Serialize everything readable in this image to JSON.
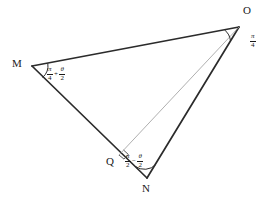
{
  "figure": {
    "type": "geometry-diagram",
    "background_color": "#ffffff",
    "stroke_color_main": "#2b2b2b",
    "stroke_color_auxiliary": "#9a9a9a",
    "vertices": [
      {
        "id": "M",
        "label": "M",
        "x": 32,
        "y": 66,
        "label_x": 12,
        "label_y": 58
      },
      {
        "id": "O",
        "label": "O",
        "x": 239,
        "y": 27,
        "label_x": 243,
        "label_y": 6
      },
      {
        "id": "N",
        "label": "N",
        "x": 147,
        "y": 178,
        "label_x": 142,
        "label_y": 184
      },
      {
        "id": "Q",
        "label": "Q",
        "x": 119,
        "y": 155,
        "label_x": 106,
        "label_y": 157
      }
    ],
    "edges": [
      {
        "id": "MO",
        "from": "M",
        "to": "O",
        "style": "solid-thick"
      },
      {
        "id": "ON",
        "from": "O",
        "to": "N",
        "style": "solid-thick"
      },
      {
        "id": "MN",
        "from": "M",
        "to": "N",
        "style": "solid-thick"
      },
      {
        "id": "OQ",
        "from": "O",
        "to": "Q",
        "style": "thin-auxiliary"
      }
    ],
    "angles": [
      {
        "id": "angle-O",
        "at": "O",
        "marker": "arc",
        "label_x": 249,
        "label_y": 33,
        "parts": [
          {
            "kind": "fraction",
            "numerator": "π",
            "denominator": "4"
          }
        ]
      },
      {
        "id": "angle-M",
        "at": "M",
        "marker": "arc",
        "label_x": 47,
        "label_y": 68,
        "parts": [
          {
            "kind": "fraction",
            "numerator": "π",
            "denominator": "4"
          },
          {
            "kind": "operator",
            "text": "+"
          },
          {
            "kind": "fraction",
            "numerator": "θ",
            "denominator": "2"
          }
        ]
      },
      {
        "id": "angle-N",
        "at": "N",
        "marker": "arc",
        "label_x": 125,
        "label_y": 155,
        "parts": [
          {
            "kind": "fraction",
            "numerator": "π",
            "denominator": "2"
          },
          {
            "kind": "operator",
            "text": "−"
          },
          {
            "kind": "fraction",
            "numerator": "θ",
            "denominator": "2"
          }
        ]
      },
      {
        "id": "angle-Q",
        "at": "Q",
        "marker": "right-angle-square",
        "label_x": 0,
        "label_y": 0,
        "parts": []
      }
    ]
  }
}
